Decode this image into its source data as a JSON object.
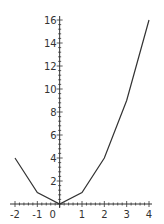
{
  "chart_data": {
    "type": "line",
    "title": "",
    "xlabel": "",
    "ylabel": "",
    "x": [
      -2,
      -1,
      0,
      1,
      2,
      3,
      4
    ],
    "series": [
      {
        "name": "y = x^2",
        "values": [
          4,
          1,
          0,
          1,
          4,
          9,
          16
        ]
      }
    ],
    "xlim": [
      -2,
      4
    ],
    "ylim": [
      0,
      16
    ],
    "x_ticks": [
      "-2",
      "-1",
      "0",
      "1",
      "2",
      "3",
      "4"
    ],
    "y_ticks": [
      "2",
      "4",
      "6",
      "8",
      "10",
      "12",
      "14",
      "16"
    ],
    "grid": false,
    "legend": "none",
    "line_color": "#333333"
  }
}
